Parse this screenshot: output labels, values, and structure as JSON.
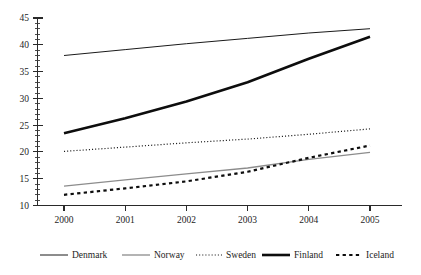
{
  "chart_data": {
    "type": "line",
    "title": "",
    "subtitle": "",
    "xlabel": "",
    "ylabel": "",
    "x": [
      2000,
      2001,
      2002,
      2003,
      2004,
      2005
    ],
    "categories": [
      "2000",
      "2001",
      "2002",
      "2003",
      "2004",
      "2005"
    ],
    "xtick_labels": [
      "2000",
      "2001",
      "2002",
      "2003",
      "2004",
      "2005"
    ],
    "ytick_labels": [
      "10",
      "15",
      "20",
      "25",
      "30",
      "35",
      "40",
      "45"
    ],
    "ytick_values": [
      10,
      15,
      20,
      25,
      30,
      35,
      40,
      45
    ],
    "ylim": [
      10,
      45
    ],
    "xlim": [
      2000,
      2005
    ],
    "grid": false,
    "minor_ticks_y": true,
    "minor_tick_interval_y": 1,
    "legend_position": "bottom",
    "series": [
      {
        "name": "Denmark",
        "values": [
          38.0,
          39.1,
          40.2,
          41.2,
          42.2,
          43.0
        ],
        "color": "#1a1a1a",
        "width": 1.0,
        "style": "solid"
      },
      {
        "name": "Norway",
        "values": [
          13.6,
          14.8,
          15.9,
          17.0,
          18.6,
          19.9
        ],
        "color": "#8c8c8c",
        "width": 1.3,
        "style": "solid"
      },
      {
        "name": "Sweden",
        "values": [
          20.1,
          20.9,
          21.7,
          22.4,
          23.3,
          24.3
        ],
        "color": "#1a1a1a",
        "width": 1.2,
        "style": "dotted"
      },
      {
        "name": "Finland",
        "values": [
          23.5,
          26.3,
          29.4,
          33.0,
          37.4,
          41.5
        ],
        "color": "#0d0d0d",
        "width": 2.6,
        "style": "solid"
      },
      {
        "name": "Iceland",
        "values": [
          12.0,
          13.2,
          14.5,
          16.3,
          18.9,
          21.2
        ],
        "color": "#0d0d0d",
        "width": 2.2,
        "style": "dashed"
      }
    ]
  },
  "legend": {
    "items": [
      {
        "label": "Denmark",
        "swatch": "line-swatch-denmark"
      },
      {
        "label": "Norway",
        "swatch": "line-swatch-norway"
      },
      {
        "label": "Sweden",
        "swatch": "line-swatch-sweden"
      },
      {
        "label": "Finland",
        "swatch": "line-swatch-finland"
      },
      {
        "label": "Iceland",
        "swatch": "line-swatch-iceland"
      }
    ]
  },
  "axes": {
    "y_labels": [
      "45",
      "40",
      "35",
      "30",
      "25",
      "20",
      "15",
      "10"
    ],
    "x_labels": [
      "2000",
      "2001",
      "2002",
      "2003",
      "2004",
      "2005"
    ]
  },
  "colors": {
    "axis": "#2a2a2a",
    "text": "#1d1d1d",
    "denmark": "#1a1a1a",
    "norway": "#8c8c8c",
    "sweden": "#1a1a1a",
    "finland": "#0d0d0d",
    "iceland": "#0d0d0d"
  }
}
